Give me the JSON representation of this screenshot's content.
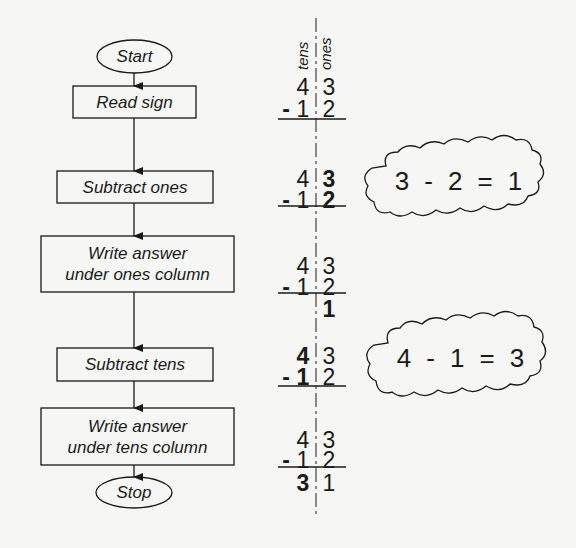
{
  "flowchart": {
    "nodes": [
      {
        "id": "start",
        "shape": "terminal",
        "lines": [
          "Start"
        ]
      },
      {
        "id": "read-sign",
        "shape": "process",
        "lines": [
          "Read sign"
        ]
      },
      {
        "id": "subtract-ones",
        "shape": "process",
        "lines": [
          "Subtract ones"
        ]
      },
      {
        "id": "write-ones",
        "shape": "process",
        "lines": [
          "Write answer",
          "under ones column"
        ]
      },
      {
        "id": "subtract-tens",
        "shape": "process",
        "lines": [
          "Subtract tens"
        ]
      },
      {
        "id": "write-tens",
        "shape": "process",
        "lines": [
          "Write answer",
          "under tens column"
        ]
      },
      {
        "id": "stop",
        "shape": "terminal",
        "lines": [
          "Stop"
        ]
      }
    ],
    "edges": [
      [
        "start",
        "read-sign"
      ],
      [
        "read-sign",
        "subtract-ones"
      ],
      [
        "subtract-ones",
        "write-ones"
      ],
      [
        "write-ones",
        "subtract-tens"
      ],
      [
        "subtract-tens",
        "write-tens"
      ],
      [
        "write-tens",
        "stop"
      ]
    ]
  },
  "columns": {
    "tens": "tens",
    "ones": "ones"
  },
  "problem": {
    "operator": "-",
    "blocks": [
      {
        "top": [
          "4",
          "3"
        ],
        "bottom": [
          "1",
          "2"
        ],
        "answer": [
          null,
          null
        ],
        "bold": []
      },
      {
        "top": [
          "4",
          "3"
        ],
        "bottom": [
          "1",
          "2"
        ],
        "answer": [
          null,
          null
        ],
        "bold": [
          "top.1",
          "bottom.1"
        ]
      },
      {
        "top": [
          "4",
          "3"
        ],
        "bottom": [
          "1",
          "2"
        ],
        "answer": [
          null,
          "1"
        ],
        "bold": [
          "answer.1"
        ]
      },
      {
        "top": [
          "4",
          "3"
        ],
        "bottom": [
          "1",
          "2"
        ],
        "answer": [
          null,
          null
        ],
        "bold": [
          "top.0",
          "bottom.0"
        ]
      },
      {
        "top": [
          "4",
          "3"
        ],
        "bottom": [
          "1",
          "2"
        ],
        "answer": [
          "3",
          "1"
        ],
        "bold": [
          "answer.0"
        ]
      }
    ]
  },
  "thought_clouds": [
    {
      "a": "3",
      "op": "-",
      "b": "2",
      "eq": "=",
      "result": "1"
    },
    {
      "a": "4",
      "op": "-",
      "b": "1",
      "eq": "=",
      "result": "3"
    }
  ],
  "colors": {
    "background": "#f6f6f4",
    "ink": "#1a1a1a"
  }
}
